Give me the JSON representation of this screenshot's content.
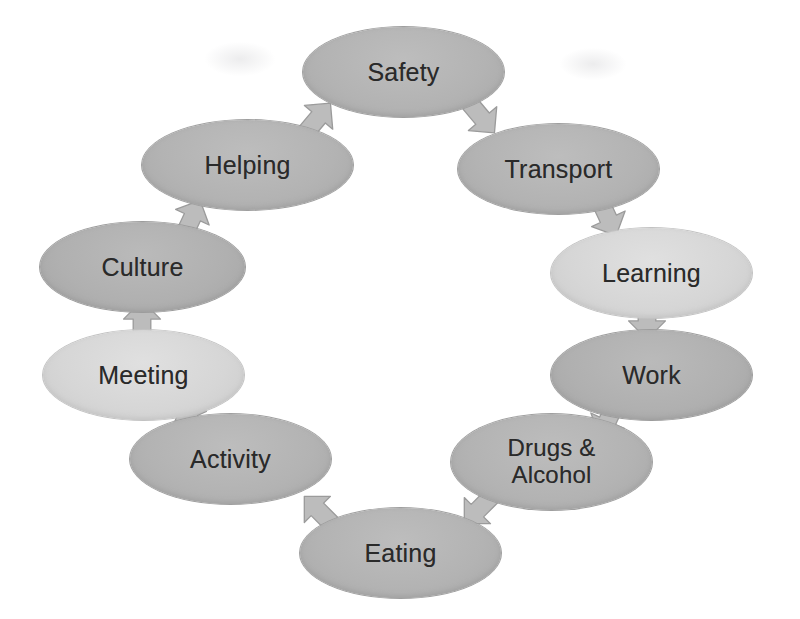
{
  "diagram": {
    "type": "cycle-diagram",
    "background_color": "#ffffff",
    "shape": "ellipse",
    "direction": "clockwise",
    "node_fill_default": "#b3b3b3",
    "node_fill_light": "#d6d6d6",
    "node_text_color": "#2a2a2a",
    "arrow_fill": "#bcbcbc",
    "arrow_stroke": "#9b9b9b",
    "nodes": [
      {
        "id": "safety",
        "label": "Safety",
        "order": 1,
        "fill": "#b3b3b3",
        "x": 303,
        "y": 27,
        "w": 201,
        "h": 90
      },
      {
        "id": "transport",
        "label": "Transport",
        "order": 2,
        "fill": "#b3b3b3",
        "x": 458,
        "y": 124,
        "w": 201,
        "h": 90
      },
      {
        "id": "learning",
        "label": "Learning",
        "order": 3,
        "fill": "#d6d6d6",
        "x": 551,
        "y": 228,
        "w": 201,
        "h": 90
      },
      {
        "id": "work",
        "label": "Work",
        "order": 4,
        "fill": "#b0b0b0",
        "x": 551,
        "y": 330,
        "w": 201,
        "h": 90
      },
      {
        "id": "drugs-alcohol",
        "label": "Drugs &\nAlcohol",
        "order": 5,
        "fill": "#b3b3b3",
        "x": 451,
        "y": 414,
        "w": 201,
        "h": 96
      },
      {
        "id": "eating",
        "label": "Eating",
        "order": 6,
        "fill": "#b3b3b3",
        "x": 300,
        "y": 508,
        "w": 201,
        "h": 90
      },
      {
        "id": "activity",
        "label": "Activity",
        "order": 7,
        "fill": "#b3b3b3",
        "x": 130,
        "y": 414,
        "w": 201,
        "h": 90
      },
      {
        "id": "meeting",
        "label": "Meeting",
        "order": 8,
        "fill": "#d6d6d6",
        "x": 43,
        "y": 330,
        "w": 201,
        "h": 90
      },
      {
        "id": "culture",
        "label": "Culture",
        "order": 9,
        "fill": "#b0b0b0",
        "x": 40,
        "y": 222,
        "w": 205,
        "h": 90
      },
      {
        "id": "helping",
        "label": "Helping",
        "order": 10,
        "fill": "#b3b3b3",
        "x": 142,
        "y": 120,
        "w": 211,
        "h": 90
      }
    ],
    "arrows": [
      {
        "id": "helping-to-safety",
        "from": "helping",
        "to": "safety",
        "x": 296,
        "y": 96,
        "size": 44,
        "rotation": 40
      },
      {
        "id": "safety-to-transport",
        "from": "safety",
        "to": "transport",
        "x": 460,
        "y": 96,
        "size": 44,
        "rotation": 140
      },
      {
        "id": "transport-to-learning",
        "from": "transport",
        "to": "learning",
        "x": 586,
        "y": 196,
        "size": 44,
        "rotation": 155
      },
      {
        "id": "learning-to-work",
        "from": "learning",
        "to": "work",
        "x": 625,
        "y": 298,
        "size": 44,
        "rotation": 180
      },
      {
        "id": "work-to-drugs",
        "from": "work",
        "to": "drugs-alcohol",
        "x": 586,
        "y": 398,
        "size": 44,
        "rotation": 205
      },
      {
        "id": "drugs-to-eating",
        "from": "drugs-alcohol",
        "to": "eating",
        "x": 456,
        "y": 488,
        "size": 44,
        "rotation": 225
      },
      {
        "id": "eating-to-activity",
        "from": "eating",
        "to": "activity",
        "x": 296,
        "y": 488,
        "size": 44,
        "rotation": 315
      },
      {
        "id": "activity-to-meeting",
        "from": "activity",
        "to": "meeting",
        "x": 168,
        "y": 398,
        "size": 44,
        "rotation": 335
      },
      {
        "id": "meeting-to-culture",
        "from": "meeting",
        "to": "culture",
        "x": 120,
        "y": 298,
        "size": 44,
        "rotation": 0
      },
      {
        "id": "culture-to-helping",
        "from": "culture",
        "to": "helping",
        "x": 170,
        "y": 196,
        "size": 44,
        "rotation": 25
      }
    ],
    "artifacts": [
      {
        "id": "smudge-left",
        "x": 205,
        "y": 42,
        "w": 70,
        "h": 34
      },
      {
        "id": "smudge-right",
        "x": 560,
        "y": 48,
        "w": 66,
        "h": 32
      }
    ]
  }
}
